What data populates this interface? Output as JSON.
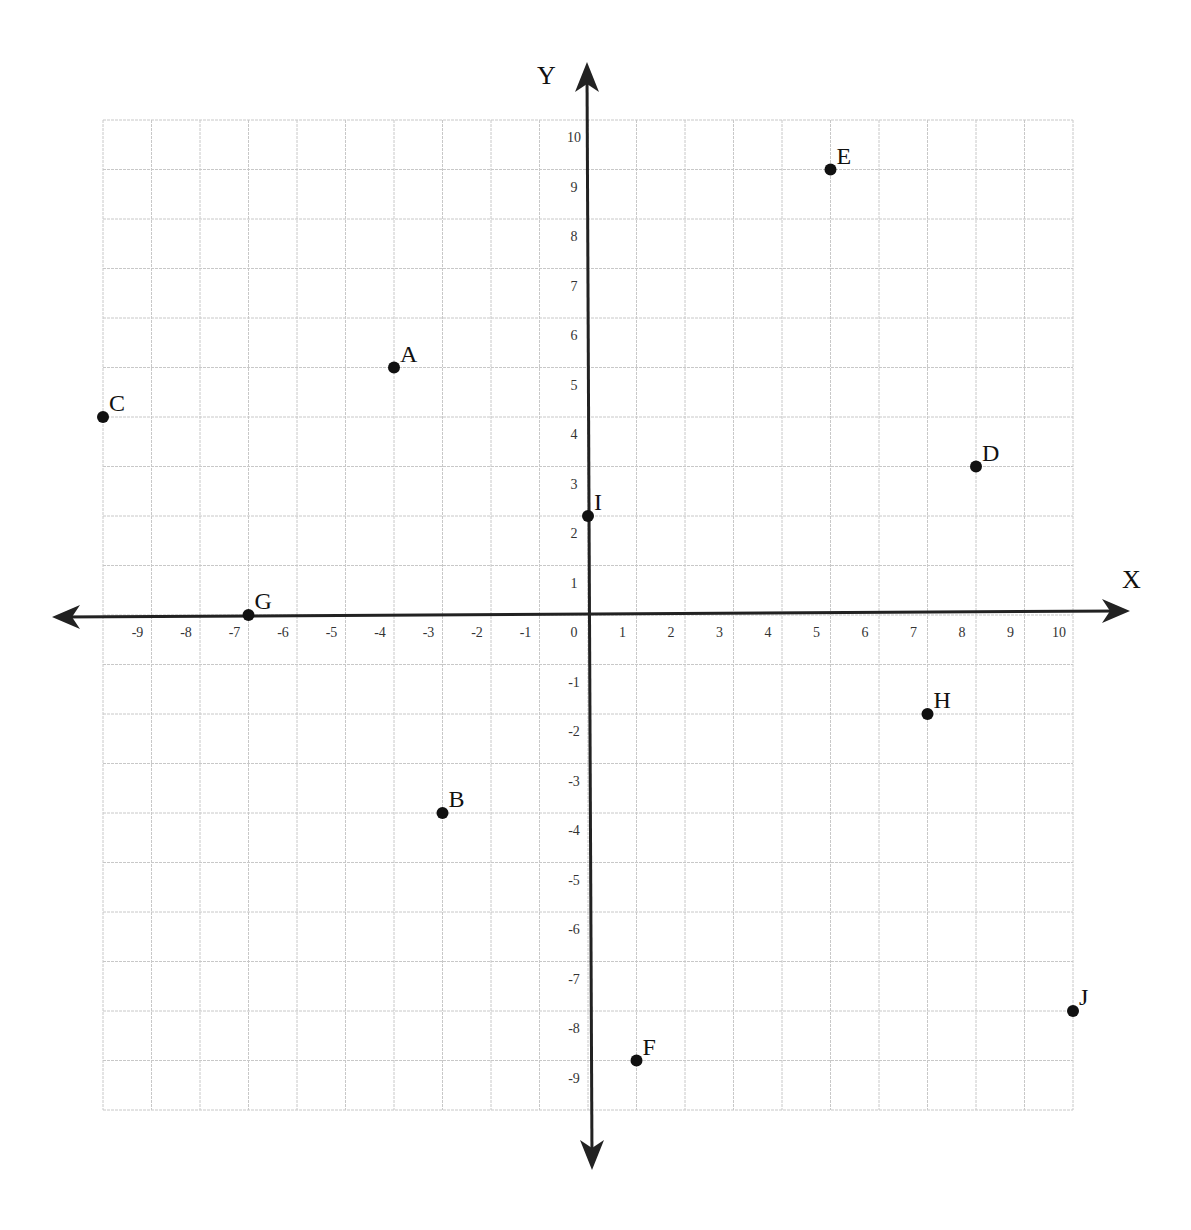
{
  "chart_data": {
    "type": "scatter",
    "title": "",
    "xlabel": "X",
    "ylabel": "Y",
    "xlim": [
      -10,
      10
    ],
    "ylim": [
      -10,
      10
    ],
    "grid": true,
    "legend": null,
    "x_ticks": [
      -9,
      -8,
      -7,
      -6,
      -5,
      -4,
      -3,
      -2,
      -1,
      0,
      1,
      2,
      3,
      4,
      5,
      6,
      7,
      8,
      9,
      10
    ],
    "y_ticks": [
      10,
      9,
      8,
      7,
      6,
      5,
      4,
      3,
      2,
      1,
      -1,
      -2,
      -3,
      -4,
      -5,
      -6,
      -7,
      -8,
      -9
    ],
    "points": [
      {
        "label": "A",
        "x": -4,
        "y": 5
      },
      {
        "label": "B",
        "x": -3,
        "y": -4
      },
      {
        "label": "C",
        "x": -10,
        "y": 4
      },
      {
        "label": "D",
        "x": 8,
        "y": 3
      },
      {
        "label": "E",
        "x": 5,
        "y": 9
      },
      {
        "label": "F",
        "x": 1,
        "y": -9
      },
      {
        "label": "G",
        "x": -7,
        "y": 0
      },
      {
        "label": "H",
        "x": 7,
        "y": -2
      },
      {
        "label": "I",
        "x": 0,
        "y": 2
      },
      {
        "label": "J",
        "x": 10,
        "y": -8
      }
    ]
  },
  "axes": {
    "x_title": "X",
    "y_title": "Y"
  }
}
